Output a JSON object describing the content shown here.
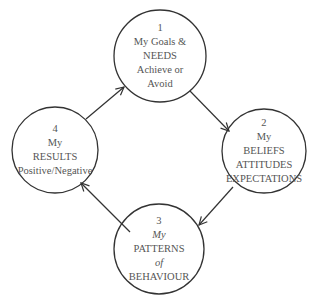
{
  "diagram": {
    "type": "cycle",
    "stroke_color": "#333333",
    "text_color": "#555555",
    "nodes": [
      {
        "id": 1,
        "cx": 160,
        "cy": 56,
        "r": 46,
        "lines": [
          "1",
          "My Goals &",
          "NEEDS",
          "Achieve or",
          "Avoid"
        ]
      },
      {
        "id": 2,
        "cx": 264,
        "cy": 151,
        "r": 42,
        "lines": [
          "2",
          "My",
          "BELIEFS",
          "ATTITUDES",
          "EXPECTATIONS"
        ]
      },
      {
        "id": 3,
        "cx": 159,
        "cy": 249,
        "r": 45,
        "lines": [
          "3",
          "My",
          "PATTERNS",
          "of",
          "BEHAVIOUR"
        ]
      },
      {
        "id": 4,
        "cx": 55,
        "cy": 150,
        "r": 43,
        "lines": [
          "4",
          "My",
          "RESULTS",
          "Positive/Negative"
        ]
      }
    ],
    "edges": [
      {
        "from": 4,
        "to": 1,
        "x1": 86,
        "y1": 119,
        "x2": 124,
        "y2": 87
      },
      {
        "from": 1,
        "to": 2,
        "x1": 190,
        "y1": 91,
        "x2": 229,
        "y2": 131
      },
      {
        "from": 2,
        "to": 3,
        "x1": 233,
        "y1": 187,
        "x2": 199,
        "y2": 225
      },
      {
        "from": 3,
        "to": 4,
        "x1": 130,
        "y1": 232,
        "x2": 81,
        "y2": 183
      }
    ]
  }
}
